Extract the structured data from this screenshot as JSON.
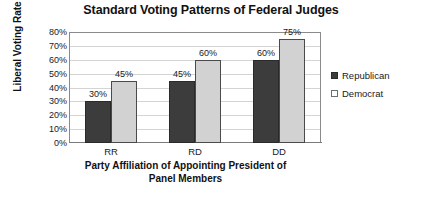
{
  "chart_data": {
    "type": "bar",
    "title": "Standard Voting Patterns of Federal Judges",
    "xlabel": "Party Affiliation of Appointing President of Panel Members",
    "xlabel_line1": "Party Affiliation of Appointing President of",
    "xlabel_line2": "Panel Members",
    "ylabel": "Liberal Voting Rate",
    "categories": [
      "RR",
      "RD",
      "DD"
    ],
    "series": [
      {
        "name": "Republican",
        "values": [
          30,
          45,
          60
        ],
        "labels": [
          "30%",
          "45%",
          "60%"
        ],
        "color": "#3c3c3c"
      },
      {
        "name": "Democrat",
        "values": [
          45,
          60,
          75
        ],
        "labels": [
          "45%",
          "60%",
          "75%"
        ],
        "color": "#d2d2d2"
      }
    ],
    "ylim": [
      0,
      80
    ],
    "ytick_values": [
      0,
      10,
      20,
      30,
      40,
      50,
      60,
      70,
      80
    ],
    "ytick_labels": [
      "0%",
      "10%",
      "20%",
      "30%",
      "40%",
      "50%",
      "60%",
      "70%",
      "80%"
    ],
    "grid": true,
    "legend_position": "right",
    "value_labels_shown": true
  },
  "legend": {
    "items": [
      {
        "label": "Republican",
        "swatch": "republican-swatch"
      },
      {
        "label": "Democrat",
        "swatch": "democrat-swatch"
      }
    ]
  }
}
